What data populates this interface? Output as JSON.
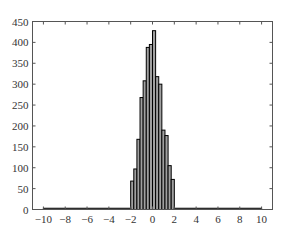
{
  "chart_data": {
    "type": "bar",
    "title": "",
    "xlabel": "",
    "ylabel": "",
    "xlim": [
      -11,
      11
    ],
    "ylim": [
      0,
      450
    ],
    "grid": false,
    "legend": null,
    "xticks": [
      -10,
      -8,
      -6,
      -4,
      -2,
      0,
      2,
      4,
      6,
      8,
      10
    ],
    "yticks": [
      0,
      50,
      100,
      150,
      200,
      250,
      300,
      350,
      400,
      450
    ],
    "bin_edges": [
      -2.0,
      -1.714,
      -1.429,
      -1.143,
      -0.857,
      -0.571,
      -0.286,
      0.0,
      0.286,
      0.571,
      0.857,
      1.143,
      1.429,
      1.714,
      2.0
    ],
    "values": [
      68,
      97,
      168,
      268,
      308,
      388,
      395,
      428,
      318,
      300,
      190,
      177,
      105,
      72
    ],
    "tails": [
      {
        "x_start": -10,
        "x_end": -2,
        "value": 3
      },
      {
        "x_start": 2,
        "x_end": 10,
        "value": 3
      }
    ],
    "bar_fill": "#a0a0a0",
    "bar_edge": "#000000"
  }
}
